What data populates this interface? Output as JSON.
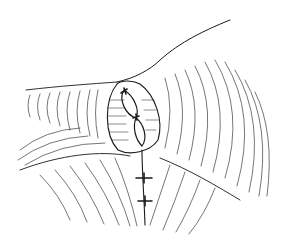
{
  "image": {
    "subject": "surgical line illustration of sutured tubular structure",
    "background": "#ffffff",
    "ink": "#1a1a1a",
    "sutures": 4
  }
}
